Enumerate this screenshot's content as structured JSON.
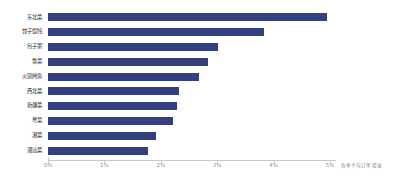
{
  "chart_data": {
    "type": "bar",
    "orientation": "horizontal",
    "title": "",
    "subtitle": "",
    "xlabel": "各季平均订单增速",
    "ylabel": "",
    "categories": [
      "东北菜",
      "饺子馄饨",
      "包子粥",
      "鲁菜",
      "火锅烤鱼",
      "西北菜",
      "新疆菜",
      "粤菜",
      "湘菜",
      "潮汕菜"
    ],
    "values": [
      4.95,
      3.83,
      3.01,
      2.84,
      2.68,
      2.32,
      2.28,
      2.21,
      1.92,
      1.77
    ],
    "value_unit": "%",
    "series": [
      {
        "name": "各季平均订单增速",
        "values": [
          4.95,
          3.83,
          3.01,
          2.84,
          2.68,
          2.32,
          2.28,
          2.21,
          1.92,
          1.77
        ]
      }
    ],
    "xlim": [
      0,
      5
    ],
    "xticks": [
      0,
      1,
      2,
      3,
      4,
      5
    ],
    "xtick_labels": [
      "0%",
      "1%",
      "2%",
      "3%",
      "4%",
      "5%"
    ],
    "grid": false,
    "legend": false,
    "legend_position": "none",
    "bar_color": "#343f7f",
    "background_color": "#ffffff",
    "axis_color": "#c9c9c9",
    "tick_label_color": "#8a8a8a",
    "category_label_color": "#2b2b2b"
  }
}
